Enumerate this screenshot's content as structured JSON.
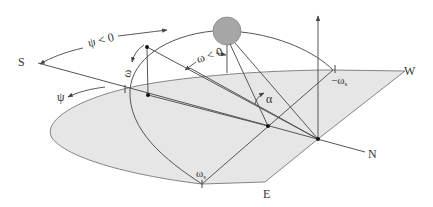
{
  "diagram": {
    "labels": {
      "south": "S",
      "north": "N",
      "west": "W",
      "east": "E",
      "azimuth": "ψ",
      "azimuth_negative": "ψ < 0",
      "hour_angle": "ω",
      "hour_angle_negative": "ω < 0",
      "altitude": "α",
      "sunset_hour_angle": "−ω",
      "sunrise_hour_angle": "ω",
      "subscript_s": "s"
    },
    "colors": {
      "ground_fill": "#e6e6e6",
      "line": "#555555",
      "sun_fill": "#a6a6a6",
      "dot": "#111111"
    }
  }
}
